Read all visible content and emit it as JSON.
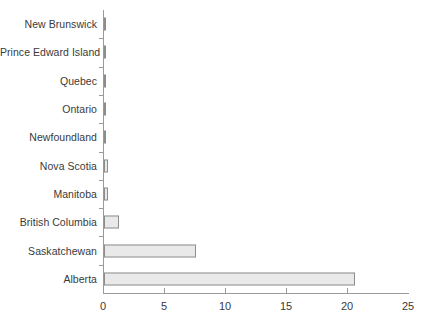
{
  "chart_data": {
    "type": "bar",
    "orientation": "horizontal",
    "title": "",
    "xlabel": "",
    "ylabel": "",
    "categories": [
      "New Brunswick",
      "Prince Edward Island",
      "Quebec",
      "Ontario",
      "Newfoundland",
      "Nova Scotia",
      "Manitoba",
      "British Columbia",
      "Saskatchewan",
      "Alberta"
    ],
    "values": [
      0.05,
      0.05,
      0.06,
      0.06,
      0.07,
      0.32,
      0.35,
      1.2,
      7.5,
      20.6
    ],
    "xlim": [
      0,
      25
    ],
    "xticks": [
      0,
      5,
      10,
      15,
      20,
      25
    ],
    "xtick_labels": [
      "0",
      "5",
      "10",
      "15",
      "20",
      "25"
    ],
    "grid": false,
    "legend": null,
    "bar_fill_color": "#e9e9e9",
    "bar_border_color": "#8d8d8d",
    "axis_color": "#9a9a9a",
    "text_color": "#3a3a3a",
    "background_color": "#ffffff"
  }
}
